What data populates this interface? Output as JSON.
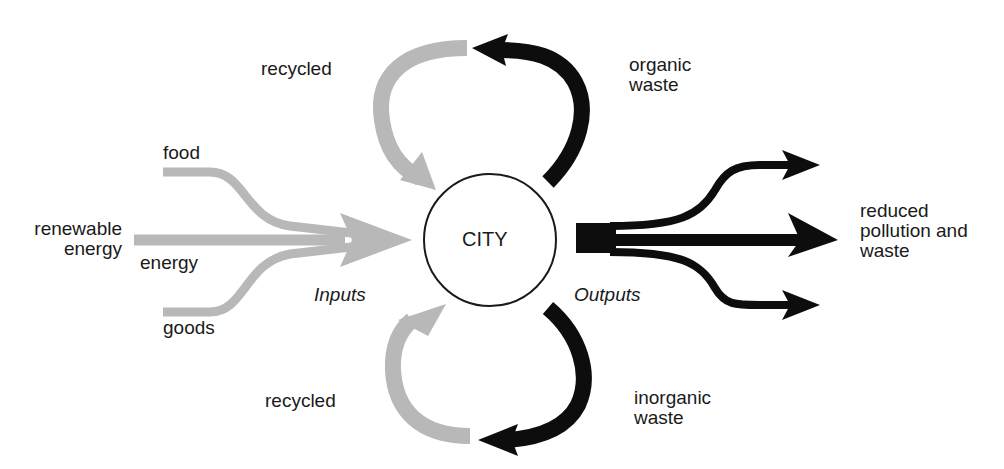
{
  "diagram": {
    "center": {
      "label": "CITY"
    },
    "labels": {
      "food": "food",
      "renewable_energy": "renewable\nenergy",
      "energy": "energy",
      "goods": "goods",
      "inputs": "Inputs",
      "outputs": "Outputs",
      "recycled_top": "recycled",
      "recycled_bottom": "recycled",
      "organic_waste": "organic\nwaste",
      "inorganic_waste": "inorganic\nwaste",
      "reduced": "reduced\npollution and\nwaste"
    },
    "colors": {
      "input": "#b8b8b8",
      "output": "#0d0d0d",
      "circle": "#1a1a1a"
    },
    "edges": [
      {
        "from": "food",
        "to": "CITY",
        "kind": "input"
      },
      {
        "from": "renewable energy",
        "to": "CITY",
        "kind": "input"
      },
      {
        "from": "goods",
        "to": "CITY",
        "kind": "input"
      },
      {
        "from": "CITY",
        "to": "organic waste",
        "kind": "output"
      },
      {
        "from": "organic waste",
        "to": "CITY",
        "kind": "recycled"
      },
      {
        "from": "CITY",
        "to": "inorganic waste",
        "kind": "output"
      },
      {
        "from": "inorganic waste",
        "to": "CITY",
        "kind": "recycled"
      },
      {
        "from": "CITY",
        "to": "reduced pollution and waste",
        "kind": "output"
      }
    ]
  }
}
